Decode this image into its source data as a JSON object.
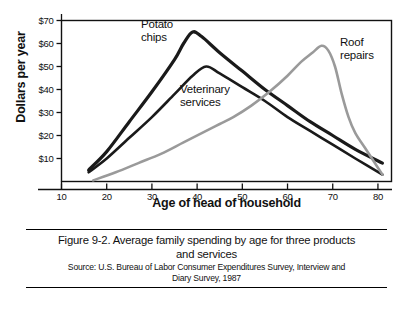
{
  "chart_data": {
    "type": "line",
    "title": "",
    "xlabel": "Age of head of household",
    "ylabel": "Dollars per year",
    "xlim": [
      10,
      83
    ],
    "ylim": [
      0,
      70
    ],
    "xticks": [
      10,
      20,
      30,
      40,
      50,
      60,
      70,
      80
    ],
    "xtick_labels": [
      "10",
      "20",
      "30",
      "40",
      "50",
      "60",
      "70",
      "80"
    ],
    "yticks": [
      10,
      20,
      30,
      40,
      50,
      60,
      70
    ],
    "ytick_labels": [
      "$10",
      "$20",
      "$30",
      "$40",
      "$50",
      "$60",
      "$70"
    ],
    "grid": false,
    "legend_position": "inline-annotations",
    "series": [
      {
        "name": "Potato chips",
        "color": "#1a1a1a",
        "line_width": 3.2,
        "label_text": "Potato\nchips",
        "points": [
          {
            "x": 16,
            "y": 5
          },
          {
            "x": 20,
            "y": 13
          },
          {
            "x": 25,
            "y": 26
          },
          {
            "x": 30,
            "y": 39
          },
          {
            "x": 35,
            "y": 53
          },
          {
            "x": 37,
            "y": 60
          },
          {
            "x": 39,
            "y": 65
          },
          {
            "x": 41,
            "y": 63
          },
          {
            "x": 45,
            "y": 56
          },
          {
            "x": 50,
            "y": 48
          },
          {
            "x": 55,
            "y": 40
          },
          {
            "x": 60,
            "y": 33
          },
          {
            "x": 65,
            "y": 26
          },
          {
            "x": 70,
            "y": 20
          },
          {
            "x": 75,
            "y": 14
          },
          {
            "x": 81,
            "y": 8
          }
        ]
      },
      {
        "name": "Veterinary services",
        "color": "#1a1a1a",
        "line_width": 2.6,
        "label_text": "Veterinary\nservices",
        "points": [
          {
            "x": 16,
            "y": 4
          },
          {
            "x": 20,
            "y": 10
          },
          {
            "x": 25,
            "y": 19
          },
          {
            "x": 30,
            "y": 28
          },
          {
            "x": 35,
            "y": 38
          },
          {
            "x": 39,
            "y": 46
          },
          {
            "x": 42,
            "y": 50
          },
          {
            "x": 45,
            "y": 47
          },
          {
            "x": 50,
            "y": 41
          },
          {
            "x": 55,
            "y": 35
          },
          {
            "x": 60,
            "y": 28
          },
          {
            "x": 65,
            "y": 22
          },
          {
            "x": 70,
            "y": 16
          },
          {
            "x": 75,
            "y": 10
          },
          {
            "x": 81,
            "y": 3
          }
        ]
      },
      {
        "name": "Roof repairs",
        "color": "#9a9a9a",
        "line_width": 2.6,
        "label_text": "Roof\nrepairs",
        "points": [
          {
            "x": 17,
            "y": 0.5
          },
          {
            "x": 22,
            "y": 4
          },
          {
            "x": 27,
            "y": 8
          },
          {
            "x": 32,
            "y": 12
          },
          {
            "x": 37,
            "y": 17
          },
          {
            "x": 42,
            "y": 22
          },
          {
            "x": 45,
            "y": 25
          },
          {
            "x": 48,
            "y": 28
          },
          {
            "x": 52,
            "y": 33
          },
          {
            "x": 56,
            "y": 39
          },
          {
            "x": 60,
            "y": 46
          },
          {
            "x": 63,
            "y": 52
          },
          {
            "x": 65.5,
            "y": 56
          },
          {
            "x": 67.5,
            "y": 59
          },
          {
            "x": 69,
            "y": 57
          },
          {
            "x": 70.5,
            "y": 50
          },
          {
            "x": 72,
            "y": 38
          },
          {
            "x": 73.5,
            "y": 28
          },
          {
            "x": 75,
            "y": 21
          },
          {
            "x": 77,
            "y": 15
          },
          {
            "x": 79,
            "y": 9
          },
          {
            "x": 81,
            "y": 3
          }
        ]
      }
    ],
    "annotations": [
      {
        "name": "potato-chips-label",
        "text_lines": [
          "Potato",
          "chips"
        ],
        "x_px": 141,
        "y_px": 18
      },
      {
        "name": "veterinary-services-label",
        "text_lines": [
          "Veterinary",
          "services"
        ],
        "x_px": 180,
        "y_px": 83
      },
      {
        "name": "roof-repairs-label",
        "text_lines": [
          "Roof",
          "repairs"
        ],
        "x_px": 340,
        "y_px": 36
      }
    ]
  },
  "caption": {
    "figure_line1": "Figure 9-2. Average family spending by age for three products",
    "figure_line2": "and services",
    "source_line1": "Source: U.S. Bureau of Labor Consumer Expenditures Survey, Interview and",
    "source_line2": "Diary Survey, 1987"
  }
}
